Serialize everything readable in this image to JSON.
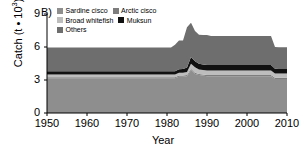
{
  "panel": {
    "label": "B)"
  },
  "axes": {
    "ylabel_main": "Catch (t ",
    "ylabel_mid": "10",
    "ylabel_sup": "3",
    "ylabel_close": ")",
    "ylabel_dot": "•",
    "xlabel": "Year",
    "yticks": [
      "0",
      "3",
      "6",
      "9"
    ],
    "xticks": [
      "1950",
      "1960",
      "1970",
      "1980",
      "1990",
      "2000",
      "2010"
    ]
  },
  "legend": {
    "rows": [
      [
        {
          "label": "Sardine cisco",
          "color": "#8e8e8e"
        },
        {
          "label": "Arctic cisco",
          "color": "#7d7d7d"
        }
      ],
      [
        {
          "label": "Broad whitefish",
          "color": "#bdbdbd"
        },
        {
          "label": "Muksun",
          "color": "#111111"
        }
      ],
      [
        {
          "label": "Others",
          "color": "#6e6e6e"
        }
      ]
    ]
  },
  "chart_data": {
    "type": "area",
    "title": "B)",
    "xlabel": "Year",
    "ylabel": "Catch (t • 10^3)",
    "xlim": [
      1950,
      2010
    ],
    "ylim": [
      0,
      9
    ],
    "yticks": [
      0,
      3,
      6,
      9
    ],
    "xticks": [
      1950,
      1960,
      1970,
      1980,
      1990,
      2000,
      2010
    ],
    "grid": false,
    "legend_position": "top",
    "stacked": true,
    "stack_order_bottom_to_top": [
      "Sardine cisco",
      "Arctic cisco",
      "Broad whitefish",
      "Muksun",
      "Others"
    ],
    "x": [
      1950,
      1951,
      1952,
      1953,
      1954,
      1955,
      1956,
      1957,
      1958,
      1959,
      1960,
      1961,
      1962,
      1963,
      1964,
      1965,
      1966,
      1967,
      1968,
      1969,
      1970,
      1971,
      1972,
      1973,
      1974,
      1975,
      1976,
      1977,
      1978,
      1979,
      1980,
      1981,
      1982,
      1983,
      1984,
      1985,
      1986,
      1987,
      1988,
      1989,
      1990,
      1991,
      1992,
      1993,
      1994,
      1995,
      1996,
      1997,
      1998,
      1999,
      2000,
      2001,
      2002,
      2003,
      2004,
      2005,
      2006,
      2007,
      2008,
      2009,
      2010
    ],
    "series": [
      {
        "name": "Sardine cisco",
        "color": "#8e8e8e",
        "values": [
          3.15,
          3.15,
          3.15,
          3.15,
          3.15,
          3.15,
          3.15,
          3.15,
          3.15,
          3.15,
          3.15,
          3.15,
          3.15,
          3.15,
          3.15,
          3.15,
          3.15,
          3.15,
          3.15,
          3.15,
          3.15,
          3.15,
          3.15,
          3.15,
          3.15,
          3.15,
          3.15,
          3.15,
          3.15,
          3.15,
          3.15,
          3.15,
          3.15,
          3.3,
          3.3,
          3.35,
          3.9,
          3.55,
          3.45,
          3.4,
          3.35,
          3.35,
          3.35,
          3.35,
          3.35,
          3.35,
          3.35,
          3.35,
          3.35,
          3.35,
          3.35,
          3.35,
          3.35,
          3.35,
          3.35,
          3.35,
          3.35,
          3.1,
          3.1,
          3.1,
          3.1
        ]
      },
      {
        "name": "Arctic cisco",
        "color": "#7d7d7d",
        "values": [
          0.1,
          0.1,
          0.1,
          0.1,
          0.1,
          0.1,
          0.1,
          0.1,
          0.1,
          0.1,
          0.1,
          0.1,
          0.1,
          0.1,
          0.1,
          0.1,
          0.1,
          0.1,
          0.1,
          0.1,
          0.1,
          0.1,
          0.1,
          0.1,
          0.1,
          0.1,
          0.1,
          0.1,
          0.1,
          0.1,
          0.1,
          0.1,
          0.1,
          0.1,
          0.1,
          0.1,
          0.12,
          0.11,
          0.1,
          0.1,
          0.1,
          0.1,
          0.1,
          0.1,
          0.1,
          0.1,
          0.1,
          0.1,
          0.1,
          0.1,
          0.1,
          0.1,
          0.1,
          0.1,
          0.1,
          0.1,
          0.1,
          0.1,
          0.1,
          0.1,
          0.1
        ]
      },
      {
        "name": "Broad whitefish",
        "color": "#bdbdbd",
        "values": [
          0.25,
          0.25,
          0.25,
          0.25,
          0.25,
          0.25,
          0.25,
          0.25,
          0.25,
          0.25,
          0.25,
          0.25,
          0.25,
          0.25,
          0.25,
          0.25,
          0.25,
          0.25,
          0.25,
          0.25,
          0.25,
          0.25,
          0.25,
          0.25,
          0.25,
          0.25,
          0.25,
          0.25,
          0.25,
          0.25,
          0.25,
          0.25,
          0.25,
          0.25,
          0.25,
          0.28,
          0.45,
          0.5,
          0.4,
          0.4,
          0.42,
          0.42,
          0.42,
          0.42,
          0.42,
          0.42,
          0.42,
          0.42,
          0.42,
          0.42,
          0.42,
          0.42,
          0.42,
          0.42,
          0.42,
          0.42,
          0.42,
          0.4,
          0.4,
          0.4,
          0.4
        ]
      },
      {
        "name": "Muksun",
        "color": "#111111",
        "values": [
          0.3,
          0.3,
          0.3,
          0.3,
          0.3,
          0.3,
          0.3,
          0.3,
          0.3,
          0.3,
          0.3,
          0.3,
          0.3,
          0.3,
          0.3,
          0.3,
          0.3,
          0.3,
          0.3,
          0.3,
          0.3,
          0.3,
          0.3,
          0.3,
          0.3,
          0.3,
          0.3,
          0.3,
          0.3,
          0.3,
          0.3,
          0.3,
          0.3,
          0.32,
          0.34,
          0.4,
          0.62,
          0.55,
          0.52,
          0.5,
          0.5,
          0.5,
          0.5,
          0.5,
          0.5,
          0.5,
          0.5,
          0.5,
          0.5,
          0.5,
          0.5,
          0.5,
          0.5,
          0.5,
          0.5,
          0.5,
          0.5,
          0.42,
          0.4,
          0.4,
          0.4
        ]
      },
      {
        "name": "Others",
        "color": "#6e6e6e",
        "values": [
          2.15,
          2.15,
          2.15,
          2.15,
          2.15,
          2.15,
          2.15,
          2.15,
          2.15,
          2.15,
          2.15,
          2.15,
          2.15,
          2.15,
          2.15,
          2.15,
          2.15,
          2.15,
          2.15,
          2.15,
          2.15,
          2.15,
          2.15,
          2.15,
          2.15,
          2.15,
          2.15,
          2.15,
          2.15,
          2.15,
          2.15,
          2.15,
          2.4,
          2.63,
          2.61,
          3.67,
          3.11,
          2.74,
          2.64,
          2.68,
          2.73,
          2.63,
          2.63,
          2.63,
          2.63,
          2.63,
          2.63,
          2.63,
          2.63,
          2.63,
          2.63,
          2.63,
          2.63,
          2.63,
          2.63,
          2.63,
          2.63,
          1.98,
          1.98,
          1.98,
          1.98
        ]
      }
    ],
    "totals": [
      5.95,
      5.95,
      5.95,
      5.95,
      5.95,
      5.95,
      5.95,
      5.95,
      5.95,
      5.95,
      5.95,
      5.95,
      5.95,
      5.95,
      5.95,
      5.95,
      5.95,
      5.95,
      5.95,
      5.95,
      5.95,
      5.95,
      5.95,
      5.95,
      5.95,
      5.95,
      5.95,
      5.95,
      5.95,
      5.95,
      5.95,
      5.95,
      6.2,
      6.6,
      6.6,
      7.8,
      8.2,
      7.45,
      7.11,
      7.08,
      7.1,
      7.0,
      7.0,
      7.0,
      7.0,
      7.0,
      7.0,
      7.0,
      7.0,
      7.0,
      7.0,
      7.0,
      7.0,
      7.0,
      7.0,
      7.0,
      7.0,
      5.9,
      5.9,
      5.9,
      5.9
    ]
  }
}
